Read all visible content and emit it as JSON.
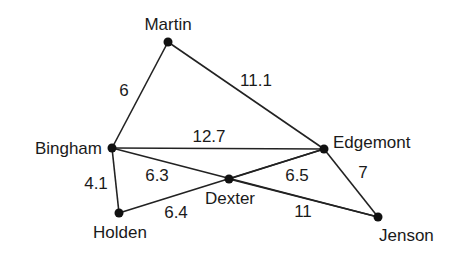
{
  "nodes": [
    {
      "id": "martin",
      "label": "Martin",
      "x": 168,
      "y": 42,
      "lx": 168,
      "ly": 30,
      "anchor": "middle"
    },
    {
      "id": "bingham",
      "label": "Bingham",
      "x": 112,
      "y": 148,
      "lx": 102,
      "ly": 154,
      "anchor": "end"
    },
    {
      "id": "edgemont",
      "label": "Edgemont",
      "x": 324,
      "y": 149,
      "lx": 333,
      "ly": 148,
      "anchor": "start"
    },
    {
      "id": "dexter",
      "label": "Dexter",
      "x": 229,
      "y": 179,
      "lx": 230,
      "ly": 204,
      "anchor": "middle"
    },
    {
      "id": "holden",
      "label": "Holden",
      "x": 119,
      "y": 213,
      "lx": 120,
      "ly": 238,
      "anchor": "middle"
    },
    {
      "id": "jenson",
      "label": "Jenson",
      "x": 378,
      "y": 217,
      "lx": 379,
      "ly": 241,
      "anchor": "start"
    }
  ],
  "edges": [
    {
      "from": "martin",
      "to": "bingham",
      "weight": "6",
      "lx": 124,
      "ly": 96
    },
    {
      "from": "martin",
      "to": "edgemont",
      "weight": "11.1",
      "lx": 256,
      "ly": 86
    },
    {
      "from": "bingham",
      "to": "edgemont",
      "weight": "12.7",
      "lx": 209,
      "ly": 142
    },
    {
      "from": "bingham",
      "to": "jenson",
      "weight": "6.3",
      "lx": 157,
      "ly": 181
    },
    {
      "from": "bingham",
      "to": "holden",
      "weight": "4.1",
      "lx": 96,
      "ly": 189
    },
    {
      "from": "holden",
      "to": "edgemont",
      "weight": "6.4",
      "lx": 176,
      "ly": 218
    },
    {
      "from": "edgemont",
      "to": "jenson",
      "weight": "7",
      "lx": 363,
      "ly": 178
    },
    {
      "from": "dexter",
      "to": "jenson",
      "weight": "11",
      "lx": 303,
      "ly": 217
    },
    {
      "from": "dexter",
      "to": "edgemont",
      "weight": "6.5",
      "lx": 297,
      "ly": 181
    }
  ]
}
